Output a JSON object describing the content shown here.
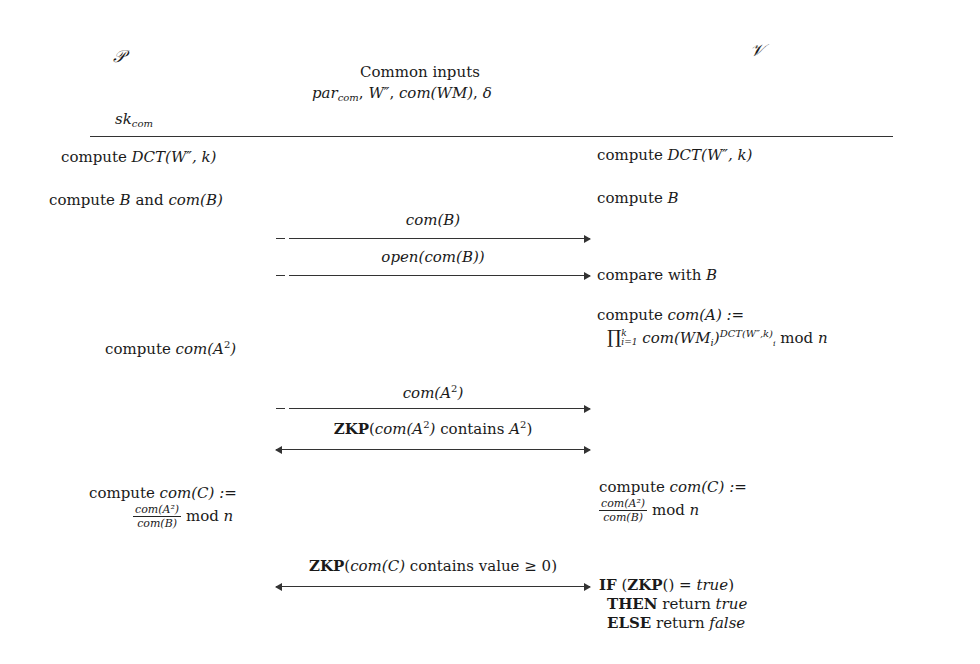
{
  "header": {
    "prover_symbol": "𝒫",
    "verifier_symbol": "𝒱",
    "common_inputs_title": "Common inputs",
    "common_inputs": {
      "par": "par",
      "par_sub": "com",
      "w": "W″",
      "com_wm": "com(WM)",
      "delta": "δ"
    },
    "prover_secret": "sk",
    "prover_secret_sub": "com"
  },
  "steps": {
    "p_dct": {
      "word": "compute ",
      "expr": "DCT(W″, k)"
    },
    "v_dct": {
      "word": "compute ",
      "expr": "DCT(W″, k)"
    },
    "p_b": {
      "word": "compute ",
      "b": "B",
      "and": " and ",
      "com": "com(B)"
    },
    "v_b": {
      "word": "compute ",
      "b": "B"
    },
    "msg1": "com(B)",
    "msg2": "open(com(B))",
    "v_compare": {
      "word": "compare with ",
      "b": "B"
    },
    "v_com_a": {
      "line1_word": "compute ",
      "line1_expr": "com(A) :=",
      "prod": "∏",
      "prod_sup": "k",
      "prod_sub": "i=1",
      "term": "com(WM",
      "term_sub": "i",
      "term_close": ")",
      "exp": "DCT(W″,k)",
      "exp_sub": "i",
      "mod": " mod ",
      "n": "n"
    },
    "p_com_a2": {
      "word": "compute ",
      "expr": "com(A",
      "sup": "2",
      "close": ")"
    },
    "msg3": {
      "expr": "com(A",
      "sup": "2",
      "close": ")"
    },
    "msg4": {
      "zkp": "ZKP",
      "open": "(",
      "expr": "com(A",
      "sup": "2",
      "close": ")",
      "contains": " contains ",
      "a": "A",
      "sup2": "2",
      "end": ")"
    },
    "p_com_c": {
      "word": "compute ",
      "expr": "com(C) :=",
      "num": "com(A²)",
      "den": "com(B)",
      "mod": " mod ",
      "n": "n"
    },
    "v_com_c": {
      "word": "compute ",
      "expr": "com(C) :=",
      "num": "com(A²)",
      "den": "com(B)",
      "mod": " mod ",
      "n": "n"
    },
    "msg5": {
      "zkp": "ZKP",
      "open": "(",
      "expr": "com(C)",
      "rest": " contains value ≥ 0)"
    },
    "v_result": {
      "if": "IF",
      "cond_open": " (",
      "zkp": "ZKP",
      "cond_mid": "() = ",
      "true1": "true",
      "cond_close": ")",
      "then": "THEN",
      "ret1": " return ",
      "true2": "true",
      "else": "ELSE",
      "ret2": " return ",
      "false": "false"
    }
  }
}
